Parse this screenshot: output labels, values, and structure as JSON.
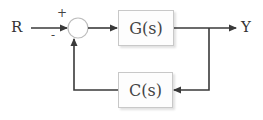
{
  "diagram": {
    "type": "negative feedback control loop",
    "input_label": "R",
    "output_label": "Y",
    "summing_junction": {
      "plus_sign": "+",
      "minus_sign": "-"
    },
    "forward_block": {
      "label": "G(s)"
    },
    "feedback_block": {
      "label": "C(s)"
    }
  },
  "colors": {
    "line": "#3a3a3a",
    "block_border": "#c8c8c8",
    "circle": "#bdbdbd",
    "text": "#333333"
  }
}
